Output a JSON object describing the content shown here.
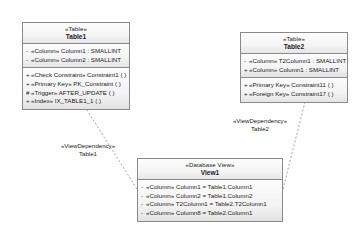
{
  "diagram": {
    "notation": "UML class diagram",
    "background_color": "#ffffff",
    "border_color": "#8a8a8a",
    "text_color": "#1b1b1b",
    "connector_color": "#8c8c8c"
  },
  "nodes": [
    {
      "id": "table1",
      "stereotype": "«Table»",
      "name": "Table1",
      "compartments": [
        {
          "kind": "attributes",
          "rows": [
            {
              "visibility": "-",
              "text": "«Column» Column1 : SMALLINT"
            },
            {
              "visibility": "-",
              "text": "«Column» Column2 : SMALLINT"
            }
          ]
        },
        {
          "kind": "operations",
          "rows": [
            {
              "visibility": "+",
              "text": "«Check Constraint» Constraint1 ( )"
            },
            {
              "visibility": "+",
              "text": "«Primary Key» PK_Constraint ( )"
            },
            {
              "visibility": "#",
              "text": "«Trigger» AFTER_UPDATE ( )"
            },
            {
              "visibility": "+",
              "text": "«Index» IX_TABLE1_1 ( )"
            }
          ]
        }
      ]
    },
    {
      "id": "table2",
      "stereotype": "«Table»",
      "name": "Table2",
      "compartments": [
        {
          "kind": "attributes",
          "rows": [
            {
              "visibility": "-",
              "text": "«Column» T2Column1 : SMALLINT"
            },
            {
              "visibility": "+",
              "text": "«Column» Column1 : SMALLINT"
            }
          ]
        },
        {
          "kind": "operations",
          "rows": [
            {
              "visibility": "+",
              "text": "«Primary Key» Constraint11 ( )"
            },
            {
              "visibility": "+",
              "text": "«Foreign Key» Constraint17 ( )"
            }
          ]
        }
      ]
    },
    {
      "id": "view1",
      "stereotype": "«Database View»",
      "name": "View1",
      "compartments": [
        {
          "kind": "attributes",
          "rows": [
            {
              "visibility": "-",
              "text": "«Column» Column1 = Table1.Column1"
            },
            {
              "visibility": "-",
              "text": "«Column» Column2 = Table1.Column2"
            },
            {
              "visibility": "-",
              "text": "«Column» T2Column1 = Table2.T2Column1"
            },
            {
              "visibility": "-",
              "text": "«Column» Column8 = Table2.Column1"
            }
          ]
        }
      ]
    }
  ],
  "connectors": [
    {
      "id": "dep-table1",
      "from": "view1",
      "to": "table1",
      "style": "dashed",
      "label_stereotype": "«ViewDependency»",
      "label_name": "Table1"
    },
    {
      "id": "dep-table2",
      "from": "view1",
      "to": "table2",
      "style": "dashed",
      "label_stereotype": "«ViewDependency»",
      "label_name": "Table2"
    }
  ]
}
